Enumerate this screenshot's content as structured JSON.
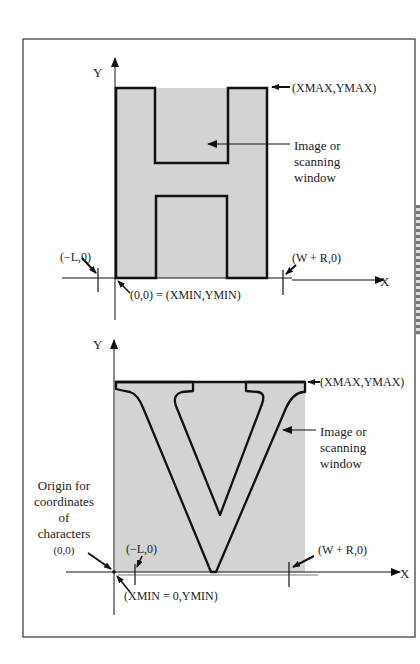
{
  "colors": {
    "fill": "#d3d3d3",
    "stroke": "#111111",
    "frame": "#333333",
    "background": "#ffffff"
  },
  "diagram_H": {
    "y_axis_label": "Y",
    "x_axis_label": "X",
    "max_corner_label": "(XMAX,YMAX)",
    "window_label_lines": [
      "Image or",
      "scanning",
      "window"
    ],
    "left_bearing_label": "(−L,0)",
    "right_bearing_label": "(W + R,0)",
    "origin_label": "(0,0) = (XMIN,YMIN)",
    "glyph": "H"
  },
  "diagram_V": {
    "y_axis_label": "Y",
    "x_axis_label": "X",
    "max_corner_label": "(XMAX,YMAX)",
    "window_label_lines": [
      "Image or",
      "scanning",
      "window"
    ],
    "origin_note_lines": [
      "Origin for",
      "coordinates",
      "of",
      "characters",
      "(0,0)"
    ],
    "left_bearing_label": "(−L,0)",
    "right_bearing_label": "(W + R,0)",
    "min_label": "(XMIN = 0,YMIN)",
    "glyph": "V"
  }
}
